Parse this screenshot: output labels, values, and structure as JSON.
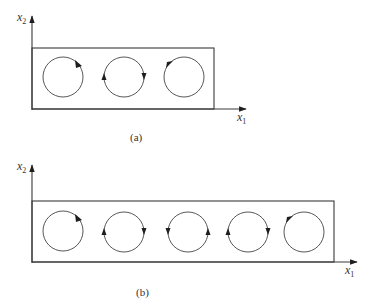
{
  "panels": [
    {
      "id": "a",
      "caption": "(a)",
      "x_axis_label": "x",
      "x_axis_sub": "1",
      "y_axis_label": "x",
      "y_axis_sub": "2",
      "cells": [
        {
          "rotation": "clockwise"
        },
        {
          "rotation": "clockwise"
        },
        {
          "rotation": "clockwise"
        }
      ]
    },
    {
      "id": "b",
      "caption": "(b)",
      "x_axis_label": "x",
      "x_axis_sub": "1",
      "y_axis_label": "x",
      "y_axis_sub": "2",
      "cells": [
        {
          "rotation": "clockwise"
        },
        {
          "rotation": "clockwise"
        },
        {
          "rotation": "counter-clockwise"
        },
        {
          "rotation": "clockwise"
        },
        {
          "rotation": "clockwise"
        }
      ]
    }
  ]
}
